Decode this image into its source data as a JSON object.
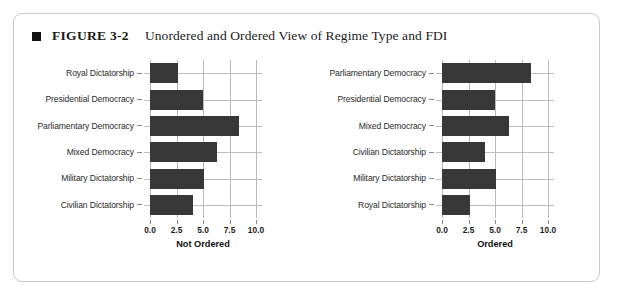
{
  "figure": {
    "marker": "black-square-bullet",
    "number_label": "FIGURE 3-2",
    "title": "Unordered and Ordered View of Regime Type and FDI"
  },
  "colors": {
    "bar": "#373737",
    "gridline": "#b9b9b9",
    "border": "#c9c9c9",
    "text": "#1a1a1a"
  },
  "chart_data": [
    {
      "type": "bar",
      "orientation": "horizontal",
      "title": "",
      "xlabel": "Not Ordered",
      "ylabel": "",
      "xlim": [
        0,
        10
      ],
      "xticks": [
        0,
        2.5,
        5,
        7.5,
        10
      ],
      "xticklabels": [
        "0.0",
        "2.5",
        "5.0",
        "7.5",
        "10.0"
      ],
      "grid": "vertical",
      "legend": "none",
      "categories": [
        "Royal Dictatorship",
        "Presidential Democracy",
        "Parliamentary Democracy",
        "Mixed Democracy",
        "Military Dictatorship",
        "Civilian Dictatorship"
      ],
      "values": [
        2.6,
        5.0,
        8.4,
        6.3,
        5.1,
        4.1
      ]
    },
    {
      "type": "bar",
      "orientation": "horizontal",
      "title": "",
      "xlabel": "Ordered",
      "ylabel": "",
      "xlim": [
        0,
        10
      ],
      "xticks": [
        0,
        2.5,
        5,
        7.5,
        10
      ],
      "xticklabels": [
        "0.0",
        "2.5",
        "5.0",
        "7.5",
        "10.0"
      ],
      "grid": "vertical",
      "legend": "none",
      "categories": [
        "Parliamentary Democracy",
        "Presidential Democracy",
        "Mixed Democracy",
        "Civilian Dictatorship",
        "Military Dictatorship",
        "Royal Dictatorship"
      ],
      "values": [
        8.4,
        5.0,
        6.3,
        4.1,
        5.1,
        2.6
      ]
    }
  ]
}
